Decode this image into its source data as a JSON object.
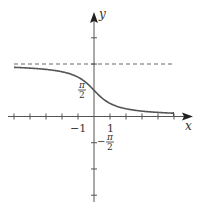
{
  "figure": {
    "axes": {
      "x_label": "x",
      "y_label": "y",
      "x_tick_labels": [
        {
          "text": "−1",
          "value": -1
        },
        {
          "text": "1",
          "value": 1
        }
      ],
      "y_tick_labels": [
        {
          "numerator": "π",
          "denominator": "2",
          "sign": "",
          "value": 1.5708
        },
        {
          "numerator": "π",
          "denominator": "2",
          "sign": "−",
          "value": -1.5708
        }
      ],
      "x_ticks": [
        -5,
        -4,
        -3,
        -2,
        -1,
        1,
        2,
        3,
        4,
        5
      ],
      "y_ticks": [
        3.1416,
        4.7124,
        -1.5708,
        -3.1416,
        -4.7124
      ]
    },
    "asymptote": {
      "y": 3.1416,
      "style": "dashed"
    },
    "curve": {
      "function": "arccot(x)",
      "x_range": [
        -5,
        5
      ]
    },
    "colors": {
      "axis": "#555555",
      "curve": "#555555",
      "asymptote": "#666666",
      "text": "#333333"
    }
  }
}
